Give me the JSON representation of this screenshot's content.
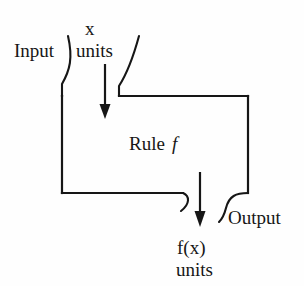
{
  "figure": {
    "type": "diagram",
    "background_color": "#fefefe",
    "stroke_color": "#161616"
  },
  "labels": {
    "input": "Input",
    "input_variable": "x",
    "input_units": "units",
    "rule_word": "Rule",
    "rule_symbol": "f",
    "output": "Output",
    "output_expression": "f(x)",
    "output_units": "units"
  },
  "arrows": {
    "input_arrow_name": "downward-arrow-into-machine",
    "output_arrow_name": "downward-arrow-out-of-machine"
  },
  "shapes": {
    "machine_box_name": "rule-machine-box",
    "top_funnel_name": "input-funnel",
    "bottom_funnel_name": "output-funnel"
  }
}
